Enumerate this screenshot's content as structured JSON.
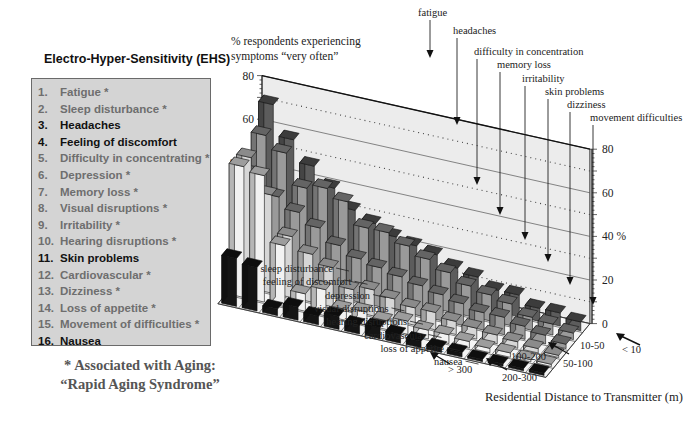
{
  "legend": {
    "title": "Electro-Hyper-Sensitivity (EHS)",
    "items": [
      {
        "num": "1.",
        "label": "Fatigue *",
        "aging": true
      },
      {
        "num": "2.",
        "label": "Sleep disturbance *",
        "aging": true
      },
      {
        "num": "3.",
        "label": "Headaches",
        "aging": false
      },
      {
        "num": "4.",
        "label": "Feeling of discomfort",
        "aging": false
      },
      {
        "num": "5.",
        "label": "Difficulty in concentrating *",
        "aging": true
      },
      {
        "num": "6.",
        "label": "Depression *",
        "aging": true
      },
      {
        "num": "7.",
        "label": "Memory loss *",
        "aging": true
      },
      {
        "num": "8.",
        "label": "Visual disruptions *",
        "aging": true
      },
      {
        "num": "9.",
        "label": "Irritability *",
        "aging": true
      },
      {
        "num": "10.",
        "label": "Hearing disruptions *",
        "aging": true
      },
      {
        "num": "11.",
        "label": "Skin problems",
        "aging": false
      },
      {
        "num": "12.",
        "label": "Cardiovascular *",
        "aging": true
      },
      {
        "num": "13.",
        "label": "Dizziness *",
        "aging": true
      },
      {
        "num": "14.",
        "label": "Loss of appetite *",
        "aging": true
      },
      {
        "num": "15.",
        "label": "Movement of difficulties *",
        "aging": true
      },
      {
        "num": "16.",
        "label": "Nausea",
        "aging": false
      }
    ],
    "footnote_line1": "* Associated with Aging:",
    "footnote_line2": "“Rapid Aging Syndrome”"
  },
  "chart_data": {
    "type": "bar",
    "subtype": "3d-bar",
    "title": "% respondents experiencing symptoms “very often”",
    "title_line1": "% respondents experiencing",
    "title_line2": "symptoms “very often”",
    "xlabel": "Residential Distance to Transmitter (m)",
    "ylabel": "%",
    "ylim": [
      0,
      80
    ],
    "yticks": [
      0,
      20,
      40,
      60,
      80
    ],
    "left_axis_labels": [
      "0",
      "20",
      "% 40",
      "60",
      "80"
    ],
    "right_axis_labels": [
      "0",
      "20",
      "40 %",
      "60",
      "80"
    ],
    "grid": true,
    "categories": [
      "< 10",
      "10-50",
      "50-100",
      "100-200",
      "200-300",
      "> 300"
    ],
    "symptoms_top_labels": [
      "fatigue",
      "headaches",
      "difficulty in concentration",
      "memory loss",
      "irritability",
      "skin problems",
      "dizziness",
      "movement difficulties"
    ],
    "symptoms_side_labels": [
      "sleep disturbance",
      "feeling of discomfort",
      "depression",
      "visual disruptions",
      "hearing disruptions",
      "cardiovascular",
      "loss of appetite",
      "nausea"
    ],
    "series": [
      {
        "name": "fatigue",
        "values": [
          72,
          62,
          48,
          60,
          60,
          22
        ]
      },
      {
        "name": "sleep disturbance",
        "values": [
          58,
          56,
          40,
          45,
          58,
          20
        ]
      },
      {
        "name": "headaches",
        "values": [
          48,
          42,
          35,
          28,
          28,
          3
        ]
      },
      {
        "name": "feeling of discomfort",
        "values": [
          40,
          44,
          30,
          22,
          8,
          6
        ]
      },
      {
        "name": "difficulty in concentration",
        "values": [
          32,
          40,
          24,
          18,
          12,
          4
        ]
      },
      {
        "name": "depression",
        "values": [
          28,
          30,
          20,
          10,
          5,
          6
        ]
      },
      {
        "name": "memory loss",
        "values": [
          24,
          30,
          18,
          12,
          6,
          4
        ]
      },
      {
        "name": "visual disruptions",
        "values": [
          22,
          26,
          16,
          10,
          4,
          5
        ]
      },
      {
        "name": "irritability",
        "values": [
          20,
          22,
          14,
          8,
          6,
          4
        ]
      },
      {
        "name": "hearing disruptions",
        "values": [
          16,
          18,
          12,
          8,
          4,
          3
        ]
      },
      {
        "name": "skin problems",
        "values": [
          14,
          14,
          10,
          6,
          4,
          2
        ]
      },
      {
        "name": "cardiovascular",
        "values": [
          10,
          12,
          8,
          5,
          3,
          2
        ]
      },
      {
        "name": "dizziness",
        "values": [
          10,
          10,
          8,
          4,
          2,
          1
        ]
      },
      {
        "name": "loss of appetite",
        "values": [
          6,
          6,
          6,
          3,
          2,
          1
        ]
      },
      {
        "name": "movement difficulties",
        "values": [
          6,
          5,
          4,
          2,
          1,
          1
        ]
      },
      {
        "name": "nausea",
        "values": [
          4,
          3,
          2,
          1,
          1,
          1
        ]
      }
    ],
    "colors": {
      "dark": "#5c5c5c",
      "mid": "#9a9a9a",
      "light": "#d6d6d6",
      "white": "#f2f2f2",
      "black": "#151515",
      "wall": "#ececec",
      "floor": "#f4f4f4"
    }
  }
}
